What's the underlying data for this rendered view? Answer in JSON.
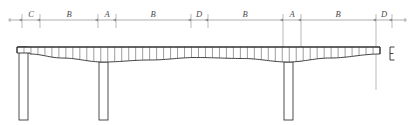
{
  "drawing": {
    "type": "bridge-elevation-technical-drawing",
    "canvas": {
      "width": 415,
      "height": 125
    },
    "colors": {
      "dimension_line": "#8c8c8c",
      "extension_line": "#8c8c8c",
      "girder_outline": "#2b2b2b",
      "girder_hatch": "#4d4d4d",
      "pier_outline": "#3a3a3a",
      "label_text": "#4a4a4a",
      "background": "#ffffff"
    }
  },
  "dimension_line": {
    "name": "span-dimension-chain",
    "y": 20,
    "x_start": 8,
    "x_end": 407,
    "segments": [
      {
        "label": "C",
        "x_start": 22,
        "x_end": 40,
        "center": 31
      },
      {
        "label": "B",
        "x_start": 40,
        "x_end": 98,
        "center": 69
      },
      {
        "label": "A",
        "x_start": 98,
        "x_end": 116,
        "center": 107
      },
      {
        "label": "B",
        "x_start": 116,
        "x_end": 191,
        "center": 153
      },
      {
        "label": "D",
        "x_start": 191,
        "x_end": 208,
        "center": 199
      },
      {
        "label": "B",
        "x_start": 208,
        "x_end": 283,
        "center": 245
      },
      {
        "label": "A",
        "x_start": 283,
        "x_end": 301,
        "center": 292
      },
      {
        "label": "B",
        "x_start": 301,
        "x_end": 376,
        "center": 338
      },
      {
        "label": "D",
        "x_start": 376,
        "x_end": 392,
        "center": 384
      }
    ],
    "tick_positions": [
      22,
      40,
      98,
      116,
      191,
      208,
      283,
      301,
      376,
      392
    ]
  },
  "girder": {
    "name": "continuous-haunched-girder",
    "top_y": 47,
    "left_x": 17,
    "right_x": 380,
    "left_end_step_y": 53,
    "left_end_step_x": 30,
    "hatch_count": 52,
    "soffit_profile": [
      {
        "x": 30,
        "y": 54
      },
      {
        "x": 62,
        "y": 58
      },
      {
        "x": 103,
        "y": 62
      },
      {
        "x": 150,
        "y": 60
      },
      {
        "x": 196,
        "y": 57.5
      },
      {
        "x": 243,
        "y": 58.5
      },
      {
        "x": 288,
        "y": 62
      },
      {
        "x": 330,
        "y": 58
      },
      {
        "x": 380,
        "y": 54
      }
    ]
  },
  "piers": [
    {
      "name": "pier-left-abutment",
      "x_left": 19,
      "x_right": 28,
      "top_y": 47,
      "bottom_y": 120
    },
    {
      "name": "pier-center-left",
      "x_left": 99,
      "x_right": 108,
      "top_y": 62,
      "bottom_y": 120
    },
    {
      "name": "pier-center-right",
      "x_left": 284,
      "x_right": 293,
      "top_y": 62,
      "bottom_y": 120
    }
  ],
  "extension_lines": [
    {
      "x": 22,
      "y_top": 14,
      "y_bottom": 28
    },
    {
      "x": 40,
      "y_top": 14,
      "y_bottom": 28
    },
    {
      "x": 98,
      "y_top": 14,
      "y_bottom": 28
    },
    {
      "x": 116,
      "y_top": 14,
      "y_bottom": 28
    },
    {
      "x": 191,
      "y_top": 14,
      "y_bottom": 28
    },
    {
      "x": 208,
      "y_top": 14,
      "y_bottom": 28
    },
    {
      "x": 283,
      "y_top": 14,
      "y_bottom": 62
    },
    {
      "x": 301,
      "y_top": 14,
      "y_bottom": 62
    },
    {
      "x": 376,
      "y_top": 14,
      "y_bottom": 90
    },
    {
      "x": 392,
      "y_top": 14,
      "y_bottom": 28
    }
  ],
  "end_marker": {
    "name": "right-end-bracket",
    "label": "E",
    "x": 390,
    "y_top": 47,
    "y_bottom": 60
  }
}
